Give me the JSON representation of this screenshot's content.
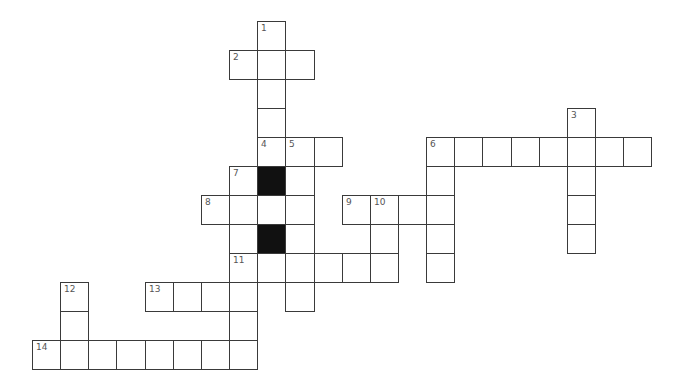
{
  "puzzle": {
    "origin": {
      "x": 32,
      "y": 21
    },
    "cell_width": 28.15,
    "cell_height": 29,
    "colors": {
      "line": "#3a3a3a",
      "fill": "#ffffff",
      "block": "#111111",
      "label": "#555555"
    },
    "entries": [
      {
        "number": "1",
        "direction": "down",
        "row": 0,
        "col": 8,
        "length": 5
      },
      {
        "number": "2",
        "direction": "across",
        "row": 1,
        "col": 7,
        "length": 3
      },
      {
        "number": "3",
        "direction": "down",
        "row": 3,
        "col": 19,
        "length": 5
      },
      {
        "number": "4",
        "direction": "across",
        "row": 4,
        "col": 8,
        "length": 3
      },
      {
        "number": "5",
        "direction": "down",
        "row": 4,
        "col": 9,
        "length": 6
      },
      {
        "number": "6",
        "direction": "across",
        "row": 4,
        "col": 14,
        "length": 8
      },
      {
        "number": "6",
        "direction": "down",
        "row": 4,
        "col": 14,
        "length": 5
      },
      {
        "number": "7",
        "direction": "down",
        "row": 5,
        "col": 7,
        "length": 7
      },
      {
        "number": "8",
        "direction": "across",
        "row": 6,
        "col": 6,
        "length": 4
      },
      {
        "number": "9",
        "direction": "across",
        "row": 6,
        "col": 11,
        "length": 4
      },
      {
        "number": "10",
        "direction": "down",
        "row": 6,
        "col": 12,
        "length": 3
      },
      {
        "number": "11",
        "direction": "across",
        "row": 8,
        "col": 7,
        "length": 6
      },
      {
        "number": "12",
        "direction": "down",
        "row": 9,
        "col": 1,
        "length": 3
      },
      {
        "number": "13",
        "direction": "across",
        "row": 9,
        "col": 4,
        "length": 4
      },
      {
        "number": "14",
        "direction": "across",
        "row": 11,
        "col": 0,
        "length": 8
      }
    ],
    "blocks": [
      {
        "row": 5,
        "col": 8
      },
      {
        "row": 7,
        "col": 8
      }
    ]
  }
}
